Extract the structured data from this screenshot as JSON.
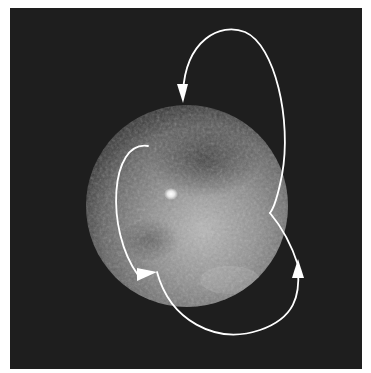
{
  "image": {
    "subject": "Dwarf planet with bright surface spot and orbit trajectory arrows",
    "background_color": "#1e1e1e",
    "planet": {
      "cx": 187,
      "cy": 206,
      "r": 101
    },
    "bright_spot": {
      "cx": 171,
      "cy": 194
    },
    "arrow_color": "#ffffff",
    "arrows": [
      {
        "name": "upper-loop",
        "direction": "downward toward planet top"
      },
      {
        "name": "left-loop",
        "direction": "down and right"
      },
      {
        "name": "lower-loop",
        "direction": "upward on right side"
      }
    ]
  }
}
